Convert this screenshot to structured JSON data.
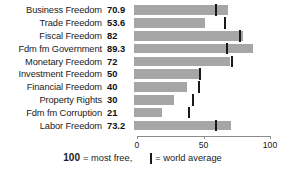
{
  "chart_data": {
    "type": "bar",
    "orientation": "horizontal",
    "title": "",
    "xlabel": "",
    "ylabel": "",
    "xlim": [
      0,
      100
    ],
    "grid": false,
    "categories": [
      "Business Freedom",
      "Trade Freedom",
      "Fiscal Freedom",
      "Fdm fm Government",
      "Monetary Freedom",
      "Investment Freedom",
      "Financial Freedom",
      "Property Rights",
      "Fdm fm Corruption",
      "Labor Freedom"
    ],
    "values": [
      70.9,
      53.6,
      82,
      89.3,
      72,
      50,
      40,
      30,
      21,
      73.2
    ],
    "value_labels": [
      "70.9",
      "53.6",
      "82",
      "89.3",
      "72",
      "50",
      "40",
      "30",
      "21",
      "73.2"
    ],
    "world_average": [
      62.0,
      68.5,
      79.5,
      70.0,
      74.0,
      49.5,
      48.5,
      44.0,
      41.0,
      62.0
    ],
    "xticks": [
      0,
      50,
      100
    ],
    "xticklabels": [
      "0",
      "50",
      "100"
    ],
    "bar_color": "#a6a6a6",
    "marker_color": "#1a1a1a",
    "axis_color": "#8c8c8c"
  },
  "legend": {
    "most_free_number": "100",
    "most_free_text": "= most free,",
    "average_text": "= world average",
    "marker_icon": "world-average-marker-icon"
  }
}
